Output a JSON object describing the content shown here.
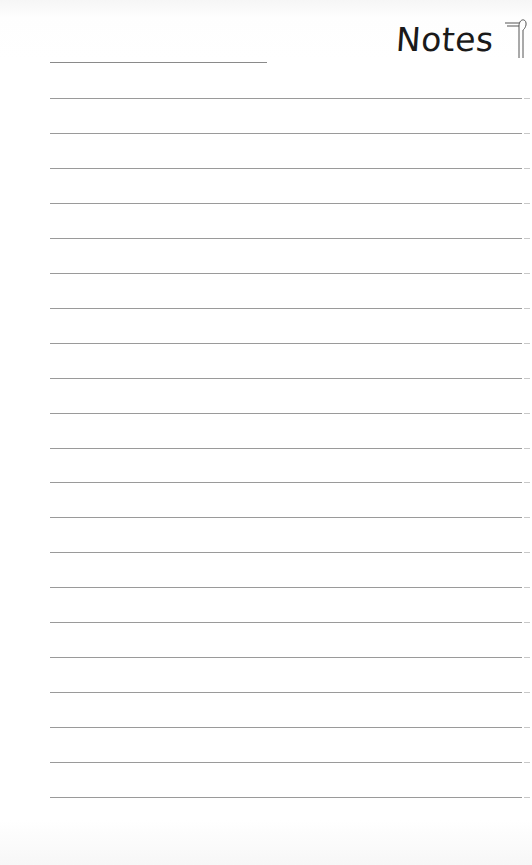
{
  "header": {
    "title": "Notes",
    "logo_icon": "pen-nib-logo-icon"
  },
  "page": {
    "name_line_present": true,
    "ruled_line_count": 21,
    "first_line_y": 98,
    "line_spacing": 34.95,
    "line_color": "#9a9a9a",
    "background_color": "#ffffff"
  }
}
